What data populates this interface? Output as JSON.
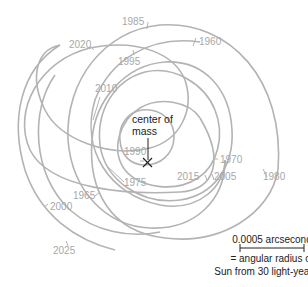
{
  "diagram": {
    "center_label_line1": "center of",
    "center_label_line2": "mass",
    "center_marker": "x-mark",
    "years": [
      "1960",
      "1965",
      "1970",
      "1975",
      "1980",
      "1985",
      "1990",
      "1995",
      "2000",
      "2005",
      "2010",
      "2015",
      "2020",
      "2025"
    ],
    "scale": {
      "value_label": "0.0005 arcsecond",
      "desc_line1": "= angular radius of",
      "desc_line2": "Sun from 30 light-years"
    },
    "colors": {
      "path": "#b3b3b3",
      "year_text": "#a8a8a8",
      "label_text": "#222222"
    }
  }
}
